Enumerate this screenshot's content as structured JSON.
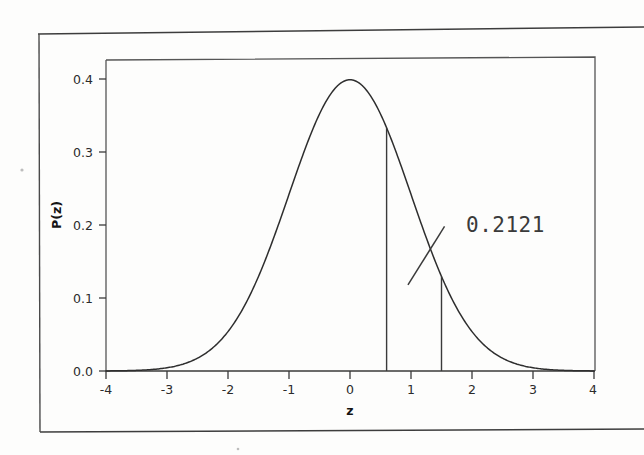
{
  "page": {
    "background_color": "#fdfdfc",
    "ink_color": "#2e2e2e",
    "top_rule": true,
    "bottom_rule": true
  },
  "chart_data": {
    "type": "line",
    "title": "",
    "subtitle": "",
    "xlabel": "z",
    "ylabel": "P(z)",
    "xlim": [
      -4,
      4
    ],
    "ylim": [
      0.0,
      0.42
    ],
    "grid": false,
    "legend": false,
    "legend_position": "none",
    "x_ticks": [
      -4,
      -3,
      -2,
      -1,
      0,
      1,
      2,
      3,
      4
    ],
    "x_tick_labels": [
      "-4",
      "-3",
      "-2",
      "-1",
      "0",
      "1",
      "2",
      "3",
      "4"
    ],
    "y_ticks": [
      0.0,
      0.1,
      0.2,
      0.3,
      0.4
    ],
    "y_tick_labels": [
      "0.0",
      "0.1",
      "0.2",
      "0.3",
      "0.4"
    ],
    "series": [
      {
        "name": "standard normal density",
        "formula": "P(z) = (1/sqrt(2*pi)) * exp(-z^2/2)",
        "x": [
          -4.0,
          -3.75,
          -3.5,
          -3.25,
          -3.0,
          -2.75,
          -2.5,
          -2.25,
          -2.0,
          -1.75,
          -1.5,
          -1.25,
          -1.0,
          -0.75,
          -0.5,
          -0.25,
          0.0,
          0.25,
          0.5,
          0.75,
          1.0,
          1.25,
          1.5,
          1.75,
          2.0,
          2.25,
          2.5,
          2.75,
          3.0,
          3.25,
          3.5,
          3.75,
          4.0
        ],
        "y": [
          0.0001,
          0.0004,
          0.0009,
          0.002,
          0.0044,
          0.0091,
          0.0175,
          0.0317,
          0.054,
          0.0863,
          0.1295,
          0.1826,
          0.242,
          0.3011,
          0.3521,
          0.3867,
          0.3989,
          0.3867,
          0.3521,
          0.3011,
          0.242,
          0.1826,
          0.1295,
          0.0863,
          0.054,
          0.0317,
          0.0175,
          0.0091,
          0.0044,
          0.002,
          0.0009,
          0.0004,
          0.0001
        ]
      }
    ],
    "vertical_markers": [
      {
        "name": "lower-bound",
        "z": 0.6,
        "y_top": 0.3332
      },
      {
        "name": "upper-bound",
        "z": 1.5,
        "y_top": 0.1295
      }
    ],
    "annotations": [
      {
        "name": "area-probability",
        "text": "0.2121",
        "points_to_region": "area under curve between z = 0.6 and z = 1.5",
        "leader_from_z": 1.55,
        "leader_from_y": 0.198,
        "leader_to_z": 0.95,
        "leader_to_y": 0.118
      }
    ]
  },
  "axes": {
    "x_axis_title": "z",
    "y_axis_title": "P(z)"
  },
  "annotation": {
    "value_text": "0.2121"
  }
}
